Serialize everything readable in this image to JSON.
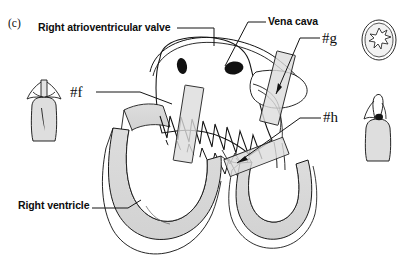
{
  "figure": {
    "panel_letter": "(c)",
    "background_color": "#ffffff",
    "ink_color": "#111111",
    "shading_color": "#d9d9d9",
    "width": 403,
    "height": 268
  },
  "labels": {
    "right_atrioventricular_valve": "Right atrioventricular valve",
    "vena_cava": "Vena cava",
    "marker_f": "#f",
    "marker_g": "#g",
    "marker_h": "#h",
    "right_ventricle": "Right ventricle"
  },
  "insets": {
    "left_vessel": "vessel-longitudinal-section",
    "top_right_oval": "vessel-cross-section",
    "bottom_right_vessel": "vessel-with-valve-section"
  }
}
